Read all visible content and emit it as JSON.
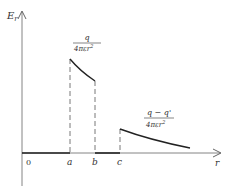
{
  "diagram": {
    "y_axis_label": "E",
    "y_axis_subscript": "r",
    "x_axis_label": "r",
    "origin_label": "0",
    "ticks": [
      "a",
      "b",
      "c"
    ],
    "region1_formula": {
      "numerator": "q",
      "denominator": "4πεr",
      "denominator_exp": "2"
    },
    "region2_formula": {
      "numerator": "q − q'",
      "denominator": "4πεr",
      "denominator_exp": "2"
    },
    "colors": {
      "line": "#222222",
      "axis": "#555555",
      "text": "#333333"
    }
  }
}
